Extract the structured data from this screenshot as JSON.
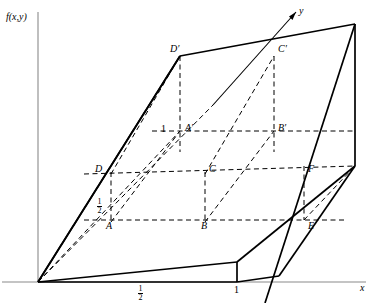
{
  "figure": {
    "type": "3d-surface-diagram",
    "axes": {
      "vertical_label": "f(x,y)",
      "depth_label": "y",
      "horizontal_label": "x",
      "x_ticks": [
        {
          "label_num": "1",
          "label_den": "2",
          "x": 141
        },
        {
          "label_plain": "1",
          "x": 237
        }
      ],
      "vertical_ticks": [
        {
          "label_plain": "1",
          "note": "height of upper level at A'"
        },
        {
          "label_num": "1",
          "label_den": "2",
          "note": "height of lower level at A"
        }
      ]
    },
    "points": [
      {
        "name": "A",
        "label": "A",
        "x": 111,
        "y": 220,
        "lx": 106,
        "ly": 221
      },
      {
        "name": "B",
        "label": "B",
        "x": 205,
        "y": 220,
        "lx": 201,
        "ly": 221
      },
      {
        "name": "C",
        "label": "C",
        "x": 205,
        "y": 172,
        "lx": 209,
        "ly": 166
      },
      {
        "name": "D",
        "label": "D",
        "x": 111,
        "y": 172,
        "lx": 97,
        "ly": 166
      },
      {
        "name": "E",
        "label": "E",
        "x": 304,
        "y": 220,
        "lx": 308,
        "ly": 221
      },
      {
        "name": "F",
        "label": "F",
        "x": 304,
        "y": 172,
        "lx": 308,
        "ly": 166
      },
      {
        "name": "A'",
        "label": "A′",
        "x": 180,
        "y": 131,
        "lx": 185,
        "ly": 125
      },
      {
        "name": "B'",
        "label": "B′",
        "x": 274,
        "y": 131,
        "lx": 278,
        "ly": 125
      },
      {
        "name": "C'",
        "label": "C′",
        "x": 274,
        "y": 56,
        "lx": 278,
        "ly": 46
      },
      {
        "name": "D'",
        "label": "D′",
        "x": 180,
        "y": 56,
        "lx": 172,
        "ly": 46
      }
    ],
    "tick_labels": {
      "axis_f": "f(x,y)",
      "axis_y": "y",
      "axis_x": "x",
      "one_upper": "1",
      "half_numerator": "1",
      "half_denominator": "2",
      "x_half_numerator": "1",
      "x_half_denominator": "2",
      "x_one": "1"
    },
    "colors": {
      "stroke": "#000000",
      "axis": "#808080",
      "background": "#ffffff"
    }
  }
}
